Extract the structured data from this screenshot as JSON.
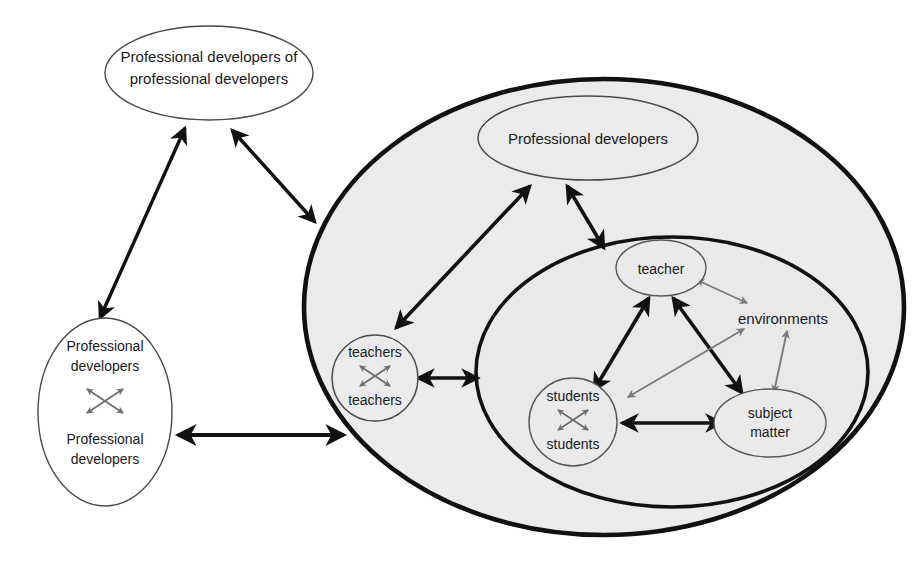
{
  "diagram": {
    "background_color": "#ffffff",
    "shell_fill": "#ebebeb",
    "instruction_fill": "#e9e9e9",
    "node_fill_light": "#f2f2f2",
    "stroke_heavy": "#111111",
    "stroke_light": "#4a4a4a",
    "arrow_heavy": "#111111",
    "arrow_light": "#7b7b7b"
  },
  "nodes": {
    "meta_developers": {
      "id": "meta-developers",
      "line1": "Professional developers of",
      "line2": "professional developers",
      "shape": "ellipse",
      "fill": "#ffffff"
    },
    "developer_dyad": {
      "id": "developer-dyad",
      "top_line1": "Professional",
      "top_line2": "developers",
      "bottom_line1": "Professional",
      "bottom_line2": "developers",
      "shape": "ellipse",
      "fill": "#ffffff",
      "inner_relation": "crossed double arrows"
    },
    "professional_developers": {
      "id": "professional-developers",
      "label": "Professional developers",
      "shape": "ellipse",
      "fill": "#ebebeb"
    },
    "teacher_dyad": {
      "id": "teacher-dyad",
      "top": "teachers",
      "bottom": "teachers",
      "shape": "circle",
      "fill": "#ebebeb",
      "inner_relation": "crossed double arrows"
    },
    "teacher": {
      "id": "teacher",
      "label": "teacher",
      "shape": "ellipse",
      "fill": "#eaeaea"
    },
    "students": {
      "id": "students",
      "top": "students",
      "bottom": "students",
      "shape": "circle",
      "fill": "#eaeaea",
      "inner_relation": "crossed double arrows"
    },
    "subject_matter": {
      "id": "subject-matter",
      "line1": "subject",
      "line2": "matter",
      "shape": "ellipse",
      "fill": "#eaeaea"
    },
    "environments": {
      "id": "environments",
      "label": "environments",
      "shape": "text-only",
      "fill": "none"
    }
  },
  "containers": {
    "professional_development_system": {
      "id": "professional-development-system",
      "description": "large outer ellipse containing professional developers, teachers dyad and the instruction system",
      "fill": "#ebebeb"
    },
    "instruction_system": {
      "id": "instruction-system",
      "description": "inner ellipse containing teacher, students, subject matter and environments",
      "fill": "#e9e9e9"
    }
  },
  "edges": [
    {
      "from": "meta_developers",
      "to": "developer_dyad",
      "style": "heavy",
      "arrows": "both"
    },
    {
      "from": "meta_developers",
      "to": "professional_development_system",
      "style": "heavy",
      "arrows": "both"
    },
    {
      "from": "developer_dyad",
      "to": "professional_development_system",
      "style": "heavy",
      "arrows": "both"
    },
    {
      "from": "professional_developers",
      "to": "teacher_dyad",
      "style": "heavy",
      "arrows": "both"
    },
    {
      "from": "professional_developers",
      "to": "instruction_system",
      "style": "heavy",
      "arrows": "both"
    },
    {
      "from": "teacher_dyad",
      "to": "instruction_system",
      "style": "heavy",
      "arrows": "both"
    },
    {
      "from": "teacher",
      "to": "students",
      "style": "heavy",
      "arrows": "both"
    },
    {
      "from": "teacher",
      "to": "subject_matter",
      "style": "heavy",
      "arrows": "both"
    },
    {
      "from": "students",
      "to": "subject_matter",
      "style": "heavy",
      "arrows": "both"
    },
    {
      "from": "environments",
      "to": "teacher",
      "style": "light",
      "arrows": "both"
    },
    {
      "from": "environments",
      "to": "students",
      "style": "light",
      "arrows": "both"
    },
    {
      "from": "environments",
      "to": "subject_matter",
      "style": "light",
      "arrows": "both"
    }
  ]
}
